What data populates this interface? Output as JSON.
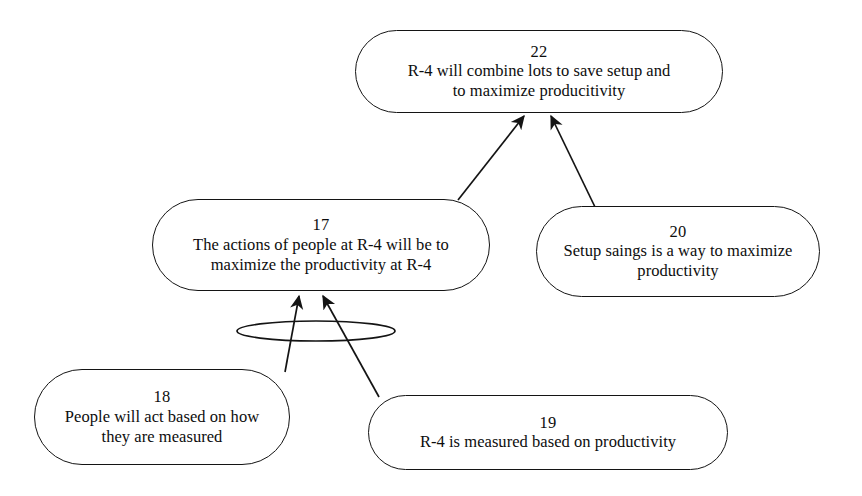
{
  "diagram": {
    "type": "logic-tree",
    "background_color": "#ffffff",
    "line_color": "#141414",
    "text_color": "#0d0d0d",
    "nodes": [
      {
        "id": "22",
        "number": "22",
        "text": "R-4 will combine lots to save setup and\nto maximize producitivity"
      },
      {
        "id": "17",
        "number": "17",
        "text": "The actions of people at R-4 will be to\nmaximize the productivity at R-4"
      },
      {
        "id": "20",
        "number": "20",
        "text": "Setup saings is a way to maximize\nproductivity"
      },
      {
        "id": "18",
        "number": "18",
        "text": "People will act based on how\nthey are measured"
      },
      {
        "id": "19",
        "number": "19",
        "text": "R-4 is measured based on productivity"
      }
    ],
    "edges": [
      {
        "from": "17",
        "to": "22",
        "grouped": false
      },
      {
        "from": "20",
        "to": "22",
        "grouped": false
      },
      {
        "from": "18",
        "to": "17",
        "grouped": true
      },
      {
        "from": "19",
        "to": "17",
        "grouped": true
      }
    ],
    "connectors": [
      {
        "kind": "and-ellipse",
        "joins": [
          "18",
          "19"
        ],
        "target": "17"
      }
    ]
  }
}
